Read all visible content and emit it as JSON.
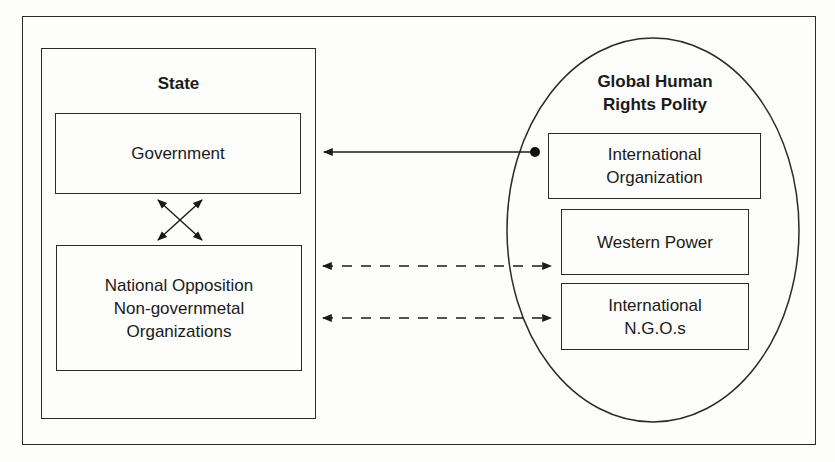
{
  "diagram": {
    "state": {
      "title": "State",
      "government": "Government",
      "opposition": "National Opposition\nNon-governmetal\nOrganizations"
    },
    "global_polity": {
      "title": "Global Human\nRights Polity",
      "international_organization": "International\nOrganization",
      "western_power": "Western Power",
      "international_ngos": "International\nN.G.O.s"
    },
    "edges": [
      {
        "from": "International Organization",
        "to": "Government",
        "style": "solid",
        "start_marker": "dot",
        "end_marker": "arrow"
      },
      {
        "from": "Government",
        "to": "National Opposition NGOs",
        "style": "solid",
        "bidirectional": true,
        "shape": "cross"
      },
      {
        "from": "National Opposition NGOs",
        "to": "Western Power",
        "style": "dashed",
        "bidirectional": true
      },
      {
        "from": "National Opposition NGOs",
        "to": "International N.G.O.s",
        "style": "dashed",
        "bidirectional": true
      }
    ],
    "colors": {
      "line": "#2a2a2a",
      "background": "#fdfdfc"
    }
  }
}
